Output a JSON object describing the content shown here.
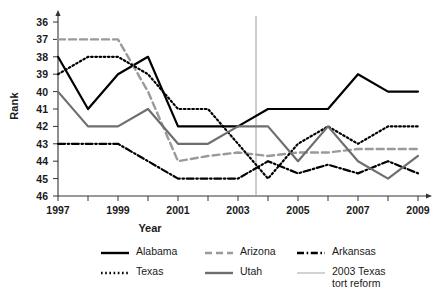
{
  "chart_data": {
    "type": "line",
    "title": "",
    "xlabel": "Year",
    "ylabel": "Rank",
    "grid": false,
    "legend_position": "bottom",
    "x": [
      1997,
      1998,
      1999,
      2000,
      2001,
      2002,
      2003,
      2004,
      2005,
      2006,
      2007,
      2008,
      2009
    ],
    "xticks": [
      "1997",
      "1999",
      "2001",
      "2003",
      "2005",
      "2007",
      "2009"
    ],
    "yticks": [
      "36",
      "37",
      "38",
      "39",
      "40",
      "41",
      "42",
      "43",
      "44",
      "45",
      "46"
    ],
    "ylim": [
      36,
      46
    ],
    "y_inverted": true,
    "xlim": [
      1997,
      2009
    ],
    "annotation": {
      "label": "2003 Texas tort reform",
      "x": 2003.6,
      "color": "#9a9a9a"
    },
    "series": [
      {
        "name": "Alabama",
        "style": "solid",
        "color": "#000000",
        "values": [
          38,
          41,
          39,
          38,
          42,
          42,
          42,
          41,
          41,
          41,
          39,
          40,
          40
        ]
      },
      {
        "name": "Arizona",
        "style": "dashed",
        "color": "#9a9a9a",
        "values": [
          37,
          37,
          37,
          40,
          44,
          43.7,
          43.5,
          43.7,
          43.5,
          43.5,
          43.3,
          43.3,
          43.3
        ]
      },
      {
        "name": "Arkansas",
        "style": "dashdot",
        "color": "#000000",
        "values": [
          43,
          43,
          43,
          44,
          45,
          45,
          45,
          44,
          44.7,
          44.2,
          44.7,
          44,
          44.7
        ]
      },
      {
        "name": "Texas",
        "style": "dotted",
        "color": "#000000",
        "values": [
          39,
          38,
          38,
          39,
          41,
          41,
          43,
          45,
          43,
          42,
          43,
          42,
          42
        ]
      },
      {
        "name": "Utah",
        "style": "solid",
        "color": "#6e6e6e",
        "values": [
          40,
          42,
          42,
          41,
          43,
          43,
          42,
          42,
          44,
          42,
          44,
          45,
          43.7
        ]
      }
    ]
  },
  "legend": {
    "items": [
      {
        "label": "Alabama",
        "style": "solid",
        "color": "#000000"
      },
      {
        "label": "Arizona",
        "style": "dashed",
        "color": "#9a9a9a"
      },
      {
        "label": "Arkansas",
        "style": "dashdot",
        "color": "#000000"
      },
      {
        "label": "Texas",
        "style": "dotted",
        "color": "#000000"
      },
      {
        "label": "Utah",
        "style": "solid",
        "color": "#6e6e6e"
      },
      {
        "label": "2003 Texas\ntort reform",
        "style": "thin",
        "color": "#b5b5b5"
      }
    ]
  }
}
